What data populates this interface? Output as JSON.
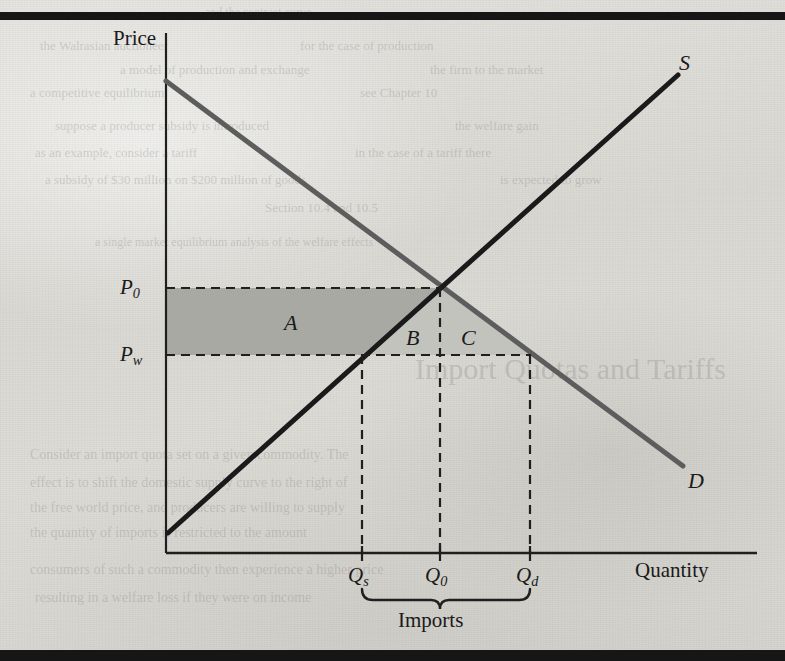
{
  "figure": {
    "type": "economics-supply-demand-diagram",
    "axes": {
      "y_label": "Price",
      "x_label": "Quantity"
    },
    "curves": [
      {
        "name": "supply",
        "label": "S",
        "color": "#1a1a1a"
      },
      {
        "name": "demand",
        "label": "D",
        "color": "#5d5d5d"
      }
    ],
    "price_ticks": [
      {
        "id": "p0",
        "base": "P",
        "subscript": "0"
      },
      {
        "id": "pw",
        "base": "P",
        "subscript": "w"
      }
    ],
    "quantity_ticks": [
      {
        "id": "qs",
        "base": "Q",
        "subscript": "s"
      },
      {
        "id": "q0",
        "base": "Q",
        "subscript": "0"
      },
      {
        "id": "qd",
        "base": "Q",
        "subscript": "d"
      }
    ],
    "regions": [
      {
        "id": "a",
        "label": "A",
        "shade": "#a9a9a4"
      },
      {
        "id": "b",
        "label": "B",
        "shade": "#c2c2bd"
      },
      {
        "id": "c",
        "label": "C",
        "shade": "#c2c2bd"
      }
    ],
    "brace_label": "Imports"
  },
  "chart_data": {
    "type": "line",
    "title": "",
    "xlabel": "Quantity",
    "ylabel": "Price",
    "grid": false,
    "legend": "inline-curve-labels",
    "xlim": [
      0,
      100
    ],
    "ylim": [
      0,
      100
    ],
    "series": [
      {
        "name": "S",
        "role": "supply",
        "color": "#1a1a1a",
        "x": [
          0,
          100
        ],
        "y": [
          4,
          96
        ],
        "description": "Upward sloping domestic supply curve"
      },
      {
        "name": "D",
        "role": "demand",
        "color": "#5d5d5d",
        "x": [
          0,
          100
        ],
        "y": [
          96,
          12
        ],
        "description": "Downward sloping domestic demand curve"
      }
    ],
    "annotations": [
      {
        "text": "P",
        "sub": "0",
        "type": "y-tick",
        "value": 53,
        "note": "autarky / domestic equilibrium price"
      },
      {
        "text": "P",
        "sub": "w",
        "type": "y-tick",
        "value": 40,
        "note": "world price"
      },
      {
        "text": "Q",
        "sub": "s",
        "type": "x-tick",
        "value": 33,
        "note": "domestic quantity supplied at world price"
      },
      {
        "text": "Q",
        "sub": "0",
        "type": "x-tick",
        "value": 47,
        "note": "equilibrium quantity at domestic price"
      },
      {
        "text": "Q",
        "sub": "d",
        "type": "x-tick",
        "value": 62,
        "note": "domestic quantity demanded at world price"
      },
      {
        "text": "A",
        "type": "region",
        "note": "rectangle between Pw and P0 from price axis to supply curve"
      },
      {
        "text": "B",
        "type": "region",
        "note": "triangle between supply curve and Q0 line"
      },
      {
        "text": "C",
        "type": "region",
        "note": "triangle between Q0 line and demand curve"
      },
      {
        "text": "Imports",
        "type": "brace",
        "span": [
          "Q_s",
          "Q_d"
        ]
      }
    ],
    "equilibrium": {
      "x": 47,
      "y": 53
    }
  },
  "bleed_through": [
    {
      "text": "and the contract curve",
      "x": 205,
      "y": 5,
      "size": 12
    },
    {
      "text": "the Walrasian auctioneer",
      "x": 40,
      "y": 38,
      "size": 13
    },
    {
      "text": "for the case of production",
      "x": 300,
      "y": 38,
      "size": 13
    },
    {
      "text": "a model of production and exchange",
      "x": 120,
      "y": 62,
      "size": 13
    },
    {
      "text": "the firm to the market",
      "x": 430,
      "y": 62,
      "size": 13
    },
    {
      "text": "a competitive equilibrium",
      "x": 30,
      "y": 85,
      "size": 13
    },
    {
      "text": "see Chapter 10",
      "x": 360,
      "y": 85,
      "size": 13
    },
    {
      "text": "suppose a producer subsidy is introduced",
      "x": 55,
      "y": 118,
      "size": 13
    },
    {
      "text": "the welfare gain",
      "x": 455,
      "y": 118,
      "size": 13
    },
    {
      "text": "as an example, consider a tariff",
      "x": 35,
      "y": 145,
      "size": 13
    },
    {
      "text": "in the case of a tariff there",
      "x": 355,
      "y": 145,
      "size": 13
    },
    {
      "text": "a subsidy of $30 million on $200 million of goods",
      "x": 45,
      "y": 172,
      "size": 13
    },
    {
      "text": "is expected to grow",
      "x": 500,
      "y": 172,
      "size": 13
    },
    {
      "text": "Section 10.4 and 10.5",
      "x": 265,
      "y": 200,
      "size": 13
    },
    {
      "text": "a single market equilibrium analysis of the welfare effects",
      "x": 95,
      "y": 235,
      "size": 12
    },
    {
      "text": "Import Quotas and Tariffs",
      "x": 415,
      "y": 352,
      "size": 30
    },
    {
      "text": "Consider an import quota set on a given commodity. The",
      "x": 30,
      "y": 447,
      "size": 14
    },
    {
      "text": "effect is to shift the domestic supply curve to the right of",
      "x": 30,
      "y": 475,
      "size": 14
    },
    {
      "text": "the free world price, and producers are willing to supply",
      "x": 30,
      "y": 500,
      "size": 14
    },
    {
      "text": "the quantity of imports is restricted to the amount",
      "x": 30,
      "y": 525,
      "size": 14
    },
    {
      "text": "consumers of such a commodity then experience a higher price",
      "x": 30,
      "y": 562,
      "size": 14
    },
    {
      "text": "resulting in a welfare loss if they were on income",
      "x": 35,
      "y": 590,
      "size": 14
    }
  ]
}
